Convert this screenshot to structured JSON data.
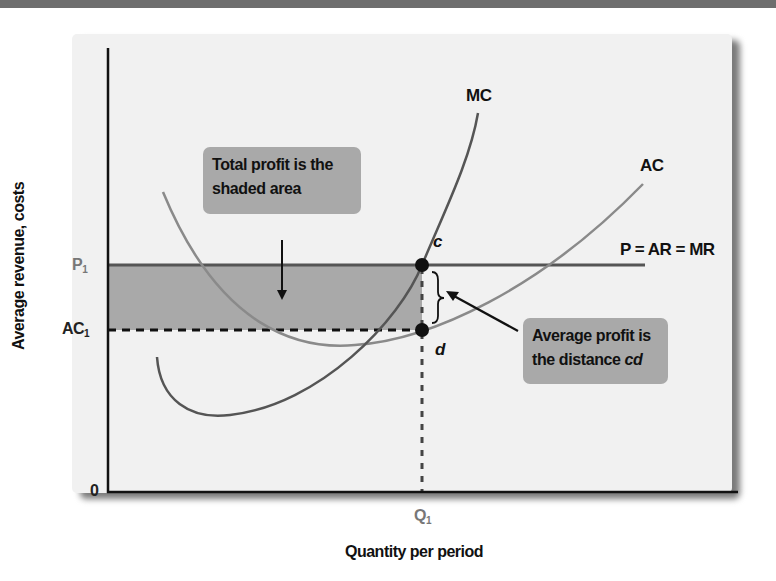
{
  "diagram": {
    "type": "economics-profit-maximization",
    "axes": {
      "y_label": "Average revenue, costs",
      "x_label": "Quantity per period",
      "origin_label": "0",
      "y_ticks": [
        {
          "label": "P",
          "subscript": "1"
        },
        {
          "label": "AC",
          "subscript": "1"
        }
      ],
      "x_ticks": [
        {
          "label": "Q",
          "subscript": "1"
        }
      ]
    },
    "curves": {
      "mc": {
        "label": "MC"
      },
      "ac": {
        "label": "AC"
      },
      "price_line": {
        "label": "P = AR = MR"
      }
    },
    "points": {
      "c": {
        "label": "c"
      },
      "d": {
        "label": "d"
      }
    },
    "callouts": {
      "total_profit": {
        "line1": "Total profit is the",
        "line2": "shaded area"
      },
      "average_profit": {
        "line1": "Average profit is",
        "line2_prefix": "the distance ",
        "line2_italic": "cd"
      }
    },
    "colors": {
      "panel_bg": "#f1f1f1",
      "shaded_area": "#a9a9a9",
      "callout_bg": "#a9a9a9",
      "mc_curve": "#555555",
      "ac_curve": "#8a8a8a",
      "price_line": "#555555",
      "axis": "#111111"
    }
  }
}
